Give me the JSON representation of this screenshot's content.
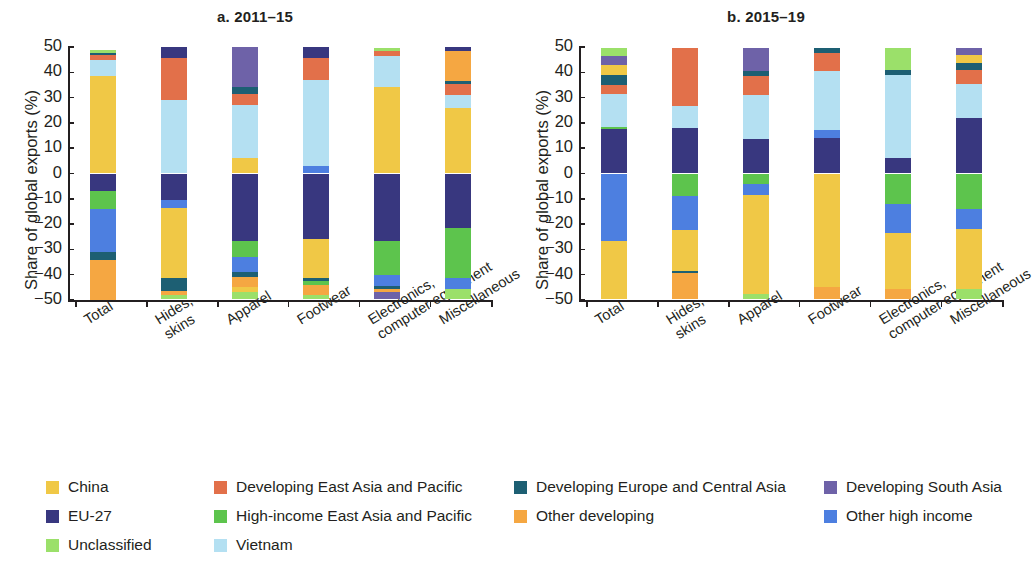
{
  "figure": {
    "ylabel": "Share of global exports (%)",
    "yticks": [
      50,
      40,
      30,
      20,
      10,
      0,
      -10,
      -20,
      -30,
      -40,
      -50
    ],
    "ytick_labels": [
      "50",
      "40",
      "30",
      "20",
      "10",
      "0",
      "−10",
      "−20",
      "−30",
      "−40",
      "−50"
    ]
  },
  "legend": {
    "items": [
      {
        "label": "China",
        "color": "#f0c846"
      },
      {
        "label": "Developing East Asia and Pacific",
        "color": "#e2704a"
      },
      {
        "label": "Developing Europe and Central Asia",
        "color": "#1d5f73"
      },
      {
        "label": "Developing South Asia",
        "color": "#6e62a8"
      },
      {
        "label": "EU-27",
        "color": "#38377f"
      },
      {
        "label": "High-income East Asia and Pacific",
        "color": "#5dc44d"
      },
      {
        "label": "Other developing",
        "color": "#f5a council"
      },
      {
        "label": "Other high income",
        "color": "#4d7fe0"
      },
      {
        "label": "Unclassified",
        "color": "#9be06a"
      },
      {
        "label": "Vietnam",
        "color": "#b4e0f2"
      }
    ]
  },
  "chart_data": [
    {
      "type": "bar",
      "subtype": "stacked-diverging",
      "title": "a. 2011–15",
      "xlabel": "",
      "ylabel": "Share of global exports (%)",
      "ylim": [
        -50,
        50
      ],
      "grid": false,
      "legend_position": "bottom",
      "categories": [
        "Total",
        "Hides, skins",
        "Apparel",
        "Footwear",
        "Electronics, computer equipment",
        "Miscellaneous"
      ],
      "series_colors": {
        "China": "#f0c846",
        "Developing East Asia and Pacific": "#e2704a",
        "Developing Europe and Central Asia": "#1d5f73",
        "Developing South Asia": "#6e62a8",
        "EU-27": "#38377f",
        "High-income East Asia and Pacific": "#5dc44d",
        "Other developing": "#f5a742",
        "Other high income": "#4d7fe0",
        "Unclassified": "#9be06a",
        "Vietnam": "#b4e0f2"
      },
      "bars": [
        {
          "category": "Total",
          "positive": [
            {
              "name": "China",
              "from": 0,
              "to": 38.5
            },
            {
              "name": "Vietnam",
              "from": 38.5,
              "to": 45.0
            },
            {
              "name": "Developing East Asia and Pacific",
              "from": 45.0,
              "to": 47.0
            },
            {
              "name": "Developing Europe and Central Asia",
              "from": 47.0,
              "to": 47.6
            },
            {
              "name": "Unclassified",
              "from": 47.6,
              "to": 49.0
            }
          ],
          "negative": [
            {
              "name": "EU-27",
              "from": 0,
              "to": -7.0
            },
            {
              "name": "High-income East Asia and Pacific",
              "from": -7.0,
              "to": -14.0
            },
            {
              "name": "Other high income",
              "from": -14.0,
              "to": -31.0
            },
            {
              "name": "Developing Europe and Central Asia",
              "from": -31.0,
              "to": -34.0
            },
            {
              "name": "Other developing",
              "from": -34.0,
              "to": -50.0
            }
          ]
        },
        {
          "category": "Hides, skins",
          "positive": [
            {
              "name": "Vietnam",
              "from": 0,
              "to": 29.0
            },
            {
              "name": "Developing East Asia and Pacific",
              "from": 29.0,
              "to": 45.5
            },
            {
              "name": "EU-27",
              "from": 45.5,
              "to": 50.0
            }
          ],
          "negative": [
            {
              "name": "EU-27",
              "from": 0,
              "to": -10.5
            },
            {
              "name": "Other high income",
              "from": -10.5,
              "to": -13.5
            },
            {
              "name": "China",
              "from": -13.5,
              "to": -41.5
            },
            {
              "name": "Developing Europe and Central Asia",
              "from": -41.5,
              "to": -46.5
            },
            {
              "name": "Other developing",
              "from": -46.5,
              "to": -48.0
            },
            {
              "name": "Unclassified",
              "from": -48.0,
              "to": -49.5
            }
          ]
        },
        {
          "category": "Apparel",
          "positive": [
            {
              "name": "China",
              "from": 0,
              "to": 6.0
            },
            {
              "name": "Vietnam",
              "from": 6.0,
              "to": 27.0
            },
            {
              "name": "Developing East Asia and Pacific",
              "from": 27.0,
              "to": 31.5
            },
            {
              "name": "Developing Europe and Central Asia",
              "from": 31.5,
              "to": 34.0
            },
            {
              "name": "Developing South Asia",
              "from": 34.0,
              "to": 50.0
            }
          ],
          "negative": [
            {
              "name": "EU-27",
              "from": 0,
              "to": -26.5
            },
            {
              "name": "High-income East Asia and Pacific",
              "from": -26.5,
              "to": -33.0
            },
            {
              "name": "Other high income",
              "from": -33.0,
              "to": -39.0
            },
            {
              "name": "Developing Europe and Central Asia",
              "from": -39.0,
              "to": -41.0
            },
            {
              "name": "Other developing",
              "from": -41.0,
              "to": -45.0
            },
            {
              "name": "China",
              "from": -45.0,
              "to": -47.0
            },
            {
              "name": "Unclassified",
              "from": -47.0,
              "to": -49.5
            }
          ]
        },
        {
          "category": "Footwear",
          "positive": [
            {
              "name": "Other high income",
              "from": 0,
              "to": 3.0
            },
            {
              "name": "Vietnam",
              "from": 3.0,
              "to": 37.0
            },
            {
              "name": "Developing East Asia and Pacific",
              "from": 37.0,
              "to": 45.5
            },
            {
              "name": "EU-27",
              "from": 45.5,
              "to": 50.0
            }
          ],
          "negative": [
            {
              "name": "EU-27",
              "from": 0,
              "to": -26.0
            },
            {
              "name": "China",
              "from": -26.0,
              "to": -41.5
            },
            {
              "name": "Developing Europe and Central Asia",
              "from": -41.5,
              "to": -42.5
            },
            {
              "name": "High-income East Asia and Pacific",
              "from": -42.5,
              "to": -44.0
            },
            {
              "name": "Other developing",
              "from": -44.0,
              "to": -48.0
            },
            {
              "name": "Unclassified",
              "from": -48.0,
              "to": -49.5
            }
          ]
        },
        {
          "category": "Electronics, computer equipment",
          "positive": [
            {
              "name": "China",
              "from": 0,
              "to": 34.0
            },
            {
              "name": "Vietnam",
              "from": 34.0,
              "to": 46.5
            },
            {
              "name": "Developing East Asia and Pacific",
              "from": 46.5,
              "to": 48.5
            },
            {
              "name": "Unclassified",
              "from": 48.5,
              "to": 49.5
            }
          ],
          "negative": [
            {
              "name": "EU-27",
              "from": 0,
              "to": -26.5
            },
            {
              "name": "High-income East Asia and Pacific",
              "from": -26.5,
              "to": -40.0
            },
            {
              "name": "Other high income",
              "from": -40.0,
              "to": -44.5
            },
            {
              "name": "Developing Europe and Central Asia",
              "from": -44.5,
              "to": -45.5
            },
            {
              "name": "Other developing",
              "from": -45.5,
              "to": -47.0
            },
            {
              "name": "Developing South Asia",
              "from": -47.0,
              "to": -49.5
            }
          ]
        },
        {
          "category": "Miscellaneous",
          "positive": [
            {
              "name": "China",
              "from": 0,
              "to": 26.0
            },
            {
              "name": "Vietnam",
              "from": 26.0,
              "to": 31.0
            },
            {
              "name": "Developing East Asia and Pacific",
              "from": 31.0,
              "to": 35.5
            },
            {
              "name": "Developing Europe and Central Asia",
              "from": 35.5,
              "to": 36.5
            },
            {
              "name": "Other developing",
              "from": 36.5,
              "to": 48.5
            },
            {
              "name": "EU-27",
              "from": 48.5,
              "to": 50.0
            }
          ],
          "negative": [
            {
              "name": "EU-27",
              "from": 0,
              "to": -21.5
            },
            {
              "name": "High-income East Asia and Pacific",
              "from": -21.5,
              "to": -41.5
            },
            {
              "name": "Other high income",
              "from": -41.5,
              "to": -45.5
            },
            {
              "name": "Unclassified",
              "from": -45.5,
              "to": -49.5
            }
          ]
        }
      ]
    },
    {
      "type": "bar",
      "subtype": "stacked-diverging",
      "title": "b. 2015–19",
      "xlabel": "",
      "ylabel": "Share of global exports (%)",
      "ylim": [
        -50,
        50
      ],
      "grid": false,
      "legend_position": "bottom",
      "categories": [
        "Total",
        "Hides, skins",
        "Apparel",
        "Footwear",
        "Electronics, computer equipment",
        "Miscellaneous"
      ],
      "bars": [
        {
          "category": "Total",
          "positive": [
            {
              "name": "EU-27",
              "from": 0,
              "to": 17.5
            },
            {
              "name": "High-income East Asia and Pacific",
              "from": 17.5,
              "to": 18.5
            },
            {
              "name": "Vietnam",
              "from": 18.5,
              "to": 31.5
            },
            {
              "name": "Developing East Asia and Pacific",
              "from": 31.5,
              "to": 35.0
            },
            {
              "name": "Developing Europe and Central Asia",
              "from": 35.0,
              "to": 39.0
            },
            {
              "name": "China",
              "from": 39.0,
              "to": 43.0
            },
            {
              "name": "Developing South Asia",
              "from": 43.0,
              "to": 46.5
            },
            {
              "name": "Unclassified",
              "from": 46.5,
              "to": 49.5
            }
          ],
          "negative": [
            {
              "name": "Other high income",
              "from": 0,
              "to": -26.5
            },
            {
              "name": "China",
              "from": -26.5,
              "to": -49.5
            }
          ]
        },
        {
          "category": "Hides, skins",
          "positive": [
            {
              "name": "EU-27",
              "from": 0,
              "to": 18.0
            },
            {
              "name": "Vietnam",
              "from": 18.0,
              "to": 26.5
            },
            {
              "name": "Developing East Asia and Pacific",
              "from": 26.5,
              "to": 49.5
            }
          ],
          "negative": [
            {
              "name": "High-income East Asia and Pacific",
              "from": 0,
              "to": -9.0
            },
            {
              "name": "Other high income",
              "from": -9.0,
              "to": -22.5
            },
            {
              "name": "China",
              "from": -22.5,
              "to": -38.5
            },
            {
              "name": "Developing Europe and Central Asia",
              "from": -38.5,
              "to": -39.5
            },
            {
              "name": "Other developing",
              "from": -39.5,
              "to": -49.5
            }
          ]
        },
        {
          "category": "Apparel",
          "positive": [
            {
              "name": "EU-27",
              "from": 0,
              "to": 13.5
            },
            {
              "name": "Vietnam",
              "from": 13.5,
              "to": 31.0
            },
            {
              "name": "Developing East Asia and Pacific",
              "from": 31.0,
              "to": 38.5
            },
            {
              "name": "Developing Europe and Central Asia",
              "from": 38.5,
              "to": 40.5
            },
            {
              "name": "Developing South Asia",
              "from": 40.5,
              "to": 49.5
            }
          ],
          "negative": [
            {
              "name": "High-income East Asia and Pacific",
              "from": 0,
              "to": -4.0
            },
            {
              "name": "Other high income",
              "from": -4.0,
              "to": -8.5
            },
            {
              "name": "China",
              "from": -8.5,
              "to": -47.5
            },
            {
              "name": "Unclassified",
              "from": -47.5,
              "to": -49.5
            }
          ]
        },
        {
          "category": "Footwear",
          "positive": [
            {
              "name": "EU-27",
              "from": 0,
              "to": 14.0
            },
            {
              "name": "Other high income",
              "from": 14.0,
              "to": 17.0
            },
            {
              "name": "Vietnam",
              "from": 17.0,
              "to": 40.5
            },
            {
              "name": "Developing East Asia and Pacific",
              "from": 40.5,
              "to": 47.5
            },
            {
              "name": "Developing Europe and Central Asia",
              "from": 47.5,
              "to": 49.5
            }
          ],
          "negative": [
            {
              "name": "China",
              "from": 0,
              "to": -45.0
            },
            {
              "name": "Other developing",
              "from": -45.0,
              "to": -49.5
            }
          ]
        },
        {
          "category": "Electronics, computer equipment",
          "positive": [
            {
              "name": "EU-27",
              "from": 0,
              "to": 6.0
            },
            {
              "name": "Vietnam",
              "from": 6.0,
              "to": 39.0
            },
            {
              "name": "Developing Europe and Central Asia",
              "from": 39.0,
              "to": 41.0
            },
            {
              "name": "Unclassified",
              "from": 41.0,
              "to": 49.5
            }
          ],
          "negative": [
            {
              "name": "High-income East Asia and Pacific",
              "from": 0,
              "to": -12.0
            },
            {
              "name": "Other high income",
              "from": -12.0,
              "to": -23.5
            },
            {
              "name": "China",
              "from": -23.5,
              "to": -45.5
            },
            {
              "name": "Other developing",
              "from": -45.5,
              "to": -49.5
            }
          ]
        },
        {
          "category": "Miscellaneous",
          "positive": [
            {
              "name": "EU-27",
              "from": 0,
              "to": 22.0
            },
            {
              "name": "Vietnam",
              "from": 22.0,
              "to": 35.5
            },
            {
              "name": "Developing East Asia and Pacific",
              "from": 35.5,
              "to": 41.0
            },
            {
              "name": "Developing Europe and Central Asia",
              "from": 41.0,
              "to": 43.5
            },
            {
              "name": "China",
              "from": 43.5,
              "to": 47.0
            },
            {
              "name": "Developing South Asia",
              "from": 47.0,
              "to": 49.5
            }
          ],
          "negative": [
            {
              "name": "High-income East Asia and Pacific",
              "from": 0,
              "to": -14.0
            },
            {
              "name": "Other high income",
              "from": -14.0,
              "to": -22.0
            },
            {
              "name": "China",
              "from": -22.0,
              "to": -45.5
            },
            {
              "name": "Unclassified",
              "from": -45.5,
              "to": -49.5
            }
          ]
        }
      ]
    }
  ]
}
